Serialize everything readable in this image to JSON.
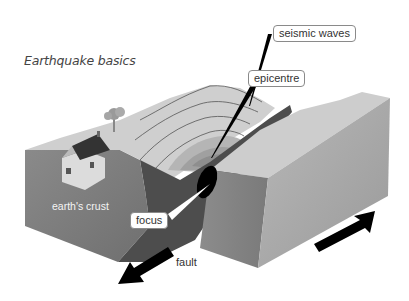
{
  "title": "Earthquake basics",
  "labels": {
    "seismic_waves": "seismic waves",
    "epicentre": "epicentre",
    "earths_crust": "earth's crust",
    "focus": "focus",
    "fault": "fault"
  },
  "colors": {
    "background": "#ffffff",
    "ground_top_light": "#c9c9c9",
    "block_front_left": "#7a7a7a",
    "block_front_right": "#a9a9a9",
    "fault_face_dark": "#4a4a4a",
    "arrow": "#000000"
  }
}
